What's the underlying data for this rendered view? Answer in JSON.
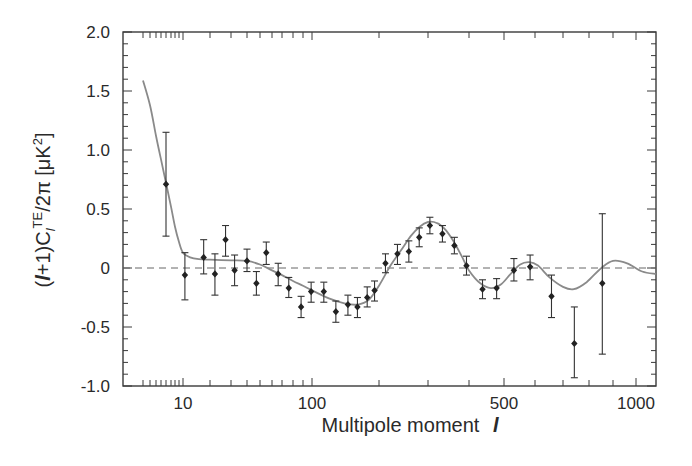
{
  "chart_data": {
    "type": "scatter",
    "title": "",
    "xlabel": "Multipole moment l",
    "ylabel": "(l+1)C_l^TE/2π [μK²]",
    "xscale": "nonlinear (WMAP-style compressed)",
    "xlim": [
      1.8,
      1100
    ],
    "ylim": [
      -1.0,
      2.0
    ],
    "grid": false,
    "legend": null,
    "x_tick_labels": [
      "10",
      "100",
      "500",
      "1000"
    ],
    "y_tick_labels": [
      "2.0",
      "1.5",
      "1.0",
      "0.5",
      "0",
      "-0.5",
      "-1.0"
    ],
    "y_ticks": [
      2.0,
      1.5,
      1.0,
      0.5,
      0,
      -0.5,
      -1.0
    ],
    "zero_line": {
      "y": 0,
      "style": "dashed"
    },
    "series": [
      {
        "name": "Data (with error bars)",
        "kind": "points",
        "points": [
          {
            "l": 6,
            "y": 0.71,
            "lo": 0.27,
            "hi": 1.15
          },
          {
            "l": 10.5,
            "y": -0.06,
            "lo": -0.27,
            "hi": 0.13
          },
          {
            "l": 17,
            "y": 0.09,
            "lo": -0.05,
            "hi": 0.24
          },
          {
            "l": 22,
            "y": -0.05,
            "lo": -0.23,
            "hi": 0.12
          },
          {
            "l": 27,
            "y": 0.24,
            "lo": 0.1,
            "hi": 0.36
          },
          {
            "l": 32,
            "y": -0.02,
            "lo": -0.15,
            "hi": 0.11
          },
          {
            "l": 40,
            "y": 0.06,
            "lo": -0.03,
            "hi": 0.16
          },
          {
            "l": 47,
            "y": -0.13,
            "lo": -0.23,
            "hi": -0.03
          },
          {
            "l": 55,
            "y": 0.13,
            "lo": 0.03,
            "hi": 0.22
          },
          {
            "l": 66,
            "y": -0.05,
            "lo": -0.15,
            "hi": 0.04
          },
          {
            "l": 76,
            "y": -0.17,
            "lo": -0.25,
            "hi": -0.08
          },
          {
            "l": 88,
            "y": -0.33,
            "lo": -0.42,
            "hi": -0.24
          },
          {
            "l": 99,
            "y": -0.2,
            "lo": -0.29,
            "hi": -0.12
          },
          {
            "l": 113,
            "y": -0.2,
            "lo": -0.29,
            "hi": -0.12
          },
          {
            "l": 128,
            "y": -0.37,
            "lo": -0.46,
            "hi": -0.28
          },
          {
            "l": 145,
            "y": -0.31,
            "lo": -0.4,
            "hi": -0.23
          },
          {
            "l": 160,
            "y": -0.33,
            "lo": -0.42,
            "hi": -0.25
          },
          {
            "l": 177,
            "y": -0.25,
            "lo": -0.33,
            "hi": -0.16
          },
          {
            "l": 191,
            "y": -0.19,
            "lo": -0.28,
            "hi": -0.11
          },
          {
            "l": 211,
            "y": 0.04,
            "lo": -0.04,
            "hi": 0.12
          },
          {
            "l": 233,
            "y": 0.12,
            "lo": 0.03,
            "hi": 0.2
          },
          {
            "l": 256,
            "y": 0.14,
            "lo": 0.05,
            "hi": 0.23
          },
          {
            "l": 279,
            "y": 0.26,
            "lo": 0.18,
            "hi": 0.34
          },
          {
            "l": 304,
            "y": 0.36,
            "lo": 0.29,
            "hi": 0.43
          },
          {
            "l": 332,
            "y": 0.29,
            "lo": 0.22,
            "hi": 0.36
          },
          {
            "l": 361,
            "y": 0.19,
            "lo": 0.12,
            "hi": 0.26
          },
          {
            "l": 393,
            "y": 0.02,
            "lo": -0.06,
            "hi": 0.1
          },
          {
            "l": 436,
            "y": -0.18,
            "lo": -0.26,
            "hi": -0.1
          },
          {
            "l": 477,
            "y": -0.17,
            "lo": -0.26,
            "hi": -0.09
          },
          {
            "l": 530,
            "y": -0.02,
            "lo": -0.11,
            "hi": 0.08
          },
          {
            "l": 583,
            "y": 0.01,
            "lo": -0.1,
            "hi": 0.11
          },
          {
            "l": 657,
            "y": -0.24,
            "lo": -0.42,
            "hi": -0.06
          },
          {
            "l": 742,
            "y": -0.64,
            "lo": -0.93,
            "hi": -0.33
          },
          {
            "l": 854,
            "y": -0.13,
            "lo": -0.73,
            "hi": 0.46
          }
        ]
      },
      {
        "name": "Best-fit model",
        "kind": "line",
        "color": "#8a8a8a",
        "points": [
          {
            "l": 2,
            "y": 1.59
          },
          {
            "l": 3,
            "y": 1.38
          },
          {
            "l": 4,
            "y": 1.12
          },
          {
            "l": 5,
            "y": 0.92
          },
          {
            "l": 6,
            "y": 0.72
          },
          {
            "l": 7,
            "y": 0.52
          },
          {
            "l": 8,
            "y": 0.35
          },
          {
            "l": 9,
            "y": 0.22
          },
          {
            "l": 10,
            "y": 0.13
          },
          {
            "l": 12,
            "y": 0.09
          },
          {
            "l": 15,
            "y": 0.075
          },
          {
            "l": 20,
            "y": 0.07
          },
          {
            "l": 30,
            "y": 0.065
          },
          {
            "l": 40,
            "y": 0.06
          },
          {
            "l": 50,
            "y": 0.03
          },
          {
            "l": 60,
            "y": -0.02
          },
          {
            "l": 70,
            "y": -0.06
          },
          {
            "l": 80,
            "y": -0.11
          },
          {
            "l": 90,
            "y": -0.15
          },
          {
            "l": 100,
            "y": -0.19
          },
          {
            "l": 120,
            "y": -0.26
          },
          {
            "l": 140,
            "y": -0.3
          },
          {
            "l": 160,
            "y": -0.31
          },
          {
            "l": 180,
            "y": -0.27
          },
          {
            "l": 200,
            "y": -0.15
          },
          {
            "l": 220,
            "y": 0.02
          },
          {
            "l": 240,
            "y": 0.15
          },
          {
            "l": 260,
            "y": 0.27
          },
          {
            "l": 280,
            "y": 0.35
          },
          {
            "l": 300,
            "y": 0.39
          },
          {
            "l": 320,
            "y": 0.38
          },
          {
            "l": 340,
            "y": 0.32
          },
          {
            "l": 360,
            "y": 0.22
          },
          {
            "l": 380,
            "y": 0.1
          },
          {
            "l": 400,
            "y": -0.02
          },
          {
            "l": 430,
            "y": -0.13
          },
          {
            "l": 460,
            "y": -0.17
          },
          {
            "l": 490,
            "y": -0.14
          },
          {
            "l": 520,
            "y": -0.05
          },
          {
            "l": 550,
            "y": 0.03
          },
          {
            "l": 580,
            "y": 0.05
          },
          {
            "l": 610,
            "y": 0.02
          },
          {
            "l": 650,
            "y": -0.08
          },
          {
            "l": 700,
            "y": -0.16
          },
          {
            "l": 740,
            "y": -0.18
          },
          {
            "l": 790,
            "y": -0.12
          },
          {
            "l": 850,
            "y": 0.0
          },
          {
            "l": 900,
            "y": 0.06
          },
          {
            "l": 960,
            "y": 0.04
          },
          {
            "l": 1030,
            "y": -0.03
          },
          {
            "l": 1100,
            "y": -0.05
          }
        ]
      }
    ],
    "x_tick_map": [
      [
        2,
        143
      ],
      [
        3,
        150
      ],
      [
        4,
        156
      ],
      [
        5,
        161
      ],
      [
        6,
        166
      ],
      [
        7,
        171
      ],
      [
        8,
        175
      ],
      [
        9,
        179
      ],
      [
        10,
        183
      ],
      [
        20,
        210
      ],
      [
        30,
        231
      ],
      [
        40,
        247
      ],
      [
        50,
        260
      ],
      [
        60,
        272
      ],
      [
        70,
        282
      ],
      [
        80,
        293
      ],
      [
        90,
        303
      ],
      [
        100,
        312
      ],
      [
        200,
        379
      ],
      [
        300,
        428
      ],
      [
        400,
        469
      ],
      [
        500,
        504
      ],
      [
        600,
        535
      ],
      [
        700,
        563
      ],
      [
        800,
        589
      ],
      [
        900,
        613
      ],
      [
        1000,
        636
      ],
      [
        1100,
        656
      ]
    ]
  },
  "labels": {
    "xlabel_text": "Multipole moment",
    "xlabel_var": "l",
    "ylabel_text": "(l+1)C_l^TE/2π [μK²]"
  }
}
